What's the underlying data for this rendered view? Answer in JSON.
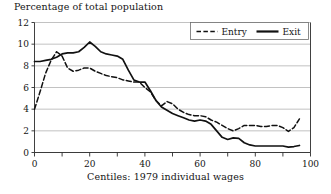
{
  "chart_data": {
    "type": "line",
    "title": "Percentage of total population",
    "xlabel": "Centiles: 1979 individual wages",
    "ylabel": "",
    "xlim": [
      0,
      100
    ],
    "ylim": [
      0,
      12
    ],
    "xticks": [
      0,
      10,
      20,
      30,
      40,
      50,
      60,
      70,
      80,
      90,
      100
    ],
    "xticklabels": [
      "0",
      "",
      "20",
      "",
      "40",
      "",
      "60",
      "",
      "80",
      "",
      "100"
    ],
    "yticks": [
      0,
      2,
      4,
      6,
      8,
      10,
      12
    ],
    "yticklabels": [
      "0",
      "2",
      "4",
      "6",
      "8",
      "10",
      "12"
    ],
    "grid": "horizontal",
    "legend_position": "top-right",
    "legend": [
      "Entry",
      "Exit"
    ],
    "series": [
      {
        "name": "Entry",
        "style": "dashed",
        "color": "#111111",
        "x": [
          0,
          2,
          4,
          6,
          8,
          10,
          12,
          14,
          16,
          18,
          20,
          22,
          24,
          26,
          28,
          30,
          32,
          34,
          36,
          38,
          40,
          42,
          44,
          46,
          48,
          50,
          52,
          54,
          56,
          58,
          60,
          62,
          64,
          66,
          68,
          70,
          72,
          74,
          76,
          78,
          80,
          82,
          84,
          86,
          88,
          90,
          92,
          94,
          96
        ],
        "values": [
          4.0,
          5.6,
          7.3,
          8.5,
          9.3,
          8.9,
          7.8,
          7.5,
          7.6,
          7.8,
          7.8,
          7.5,
          7.3,
          7.1,
          7.0,
          6.9,
          6.7,
          6.6,
          6.5,
          6.5,
          6.0,
          5.6,
          4.8,
          4.3,
          4.7,
          4.5,
          4.0,
          3.7,
          3.5,
          3.4,
          3.4,
          3.3,
          3.0,
          2.8,
          2.5,
          2.2,
          2.0,
          2.2,
          2.5,
          2.5,
          2.5,
          2.4,
          2.4,
          2.5,
          2.5,
          2.3,
          1.95,
          2.3,
          3.1
        ]
      },
      {
        "name": "Exit",
        "style": "solid",
        "color": "#111111",
        "x": [
          0,
          2,
          4,
          6,
          8,
          10,
          12,
          14,
          16,
          18,
          20,
          22,
          24,
          26,
          28,
          30,
          32,
          34,
          36,
          38,
          40,
          42,
          44,
          46,
          48,
          50,
          52,
          54,
          56,
          58,
          60,
          62,
          64,
          66,
          68,
          70,
          72,
          74,
          76,
          78,
          80,
          82,
          84,
          86,
          88,
          90,
          92,
          94,
          96
        ],
        "values": [
          8.4,
          8.4,
          8.5,
          8.6,
          8.8,
          9.1,
          9.2,
          9.2,
          9.3,
          9.7,
          10.2,
          9.8,
          9.3,
          9.1,
          9.0,
          8.9,
          8.6,
          7.6,
          6.7,
          6.5,
          6.5,
          5.7,
          4.8,
          4.2,
          3.9,
          3.6,
          3.4,
          3.2,
          3.0,
          2.9,
          3.0,
          2.9,
          2.6,
          2.0,
          1.4,
          1.2,
          1.35,
          1.3,
          0.9,
          0.7,
          0.6,
          0.6,
          0.6,
          0.6,
          0.6,
          0.6,
          0.5,
          0.55,
          0.65
        ]
      }
    ]
  }
}
